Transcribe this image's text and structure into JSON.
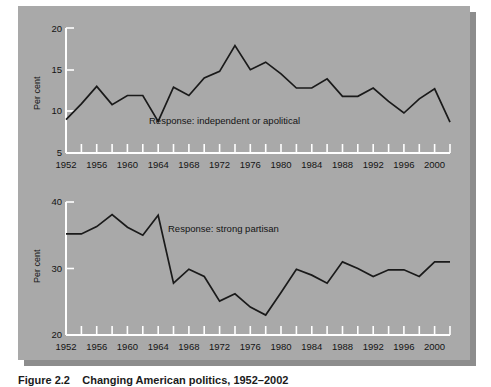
{
  "figure": {
    "caption_label": "Figure 2.2",
    "caption_text": "Changing American politics, 1952–2002",
    "background_color": "#a9a9a9",
    "shadow_color": "#8d8d8d",
    "line_color": "#1a1a1a",
    "axis_color": "#ffffff",
    "page_color": "#ffffff"
  },
  "chart_data": [
    {
      "id": "independent-apolitical",
      "type": "line",
      "title": "",
      "annotation": "Response: independent or apolitical",
      "xlabel": "",
      "ylabel": "Per cent",
      "ylim": [
        5,
        20
      ],
      "yticks": [
        5,
        10,
        15,
        20
      ],
      "ytick_labels": [
        "5",
        "10",
        "15",
        "20"
      ],
      "xlim": [
        1952,
        2002
      ],
      "xticks": [
        1952,
        1954,
        1956,
        1958,
        1960,
        1962,
        1964,
        1966,
        1968,
        1970,
        1972,
        1974,
        1976,
        1978,
        1980,
        1982,
        1984,
        1986,
        1988,
        1990,
        1992,
        1994,
        1996,
        1998,
        2000,
        2002
      ],
      "xtick_labels": [
        "1952",
        "",
        "1956",
        "",
        "1960",
        "",
        "1964",
        "",
        "1968",
        "",
        "1972",
        "",
        "1976",
        "",
        "1980",
        "",
        "1984",
        "",
        "1988",
        "",
        "1992",
        "",
        "1996",
        "",
        "2000",
        ""
      ],
      "grid": false,
      "legend": "none",
      "x": [
        1952,
        1954,
        1956,
        1958,
        1960,
        1962,
        1964,
        1966,
        1968,
        1970,
        1972,
        1974,
        1976,
        1978,
        1980,
        1982,
        1984,
        1986,
        1988,
        1990,
        1992,
        1994,
        1996,
        1998,
        2000,
        2002
      ],
      "values": [
        9.0,
        10.9,
        13.0,
        10.8,
        11.9,
        11.9,
        8.8,
        12.9,
        11.9,
        14.0,
        14.8,
        17.9,
        15.0,
        15.9,
        14.5,
        12.8,
        12.8,
        13.9,
        11.8,
        11.8,
        12.8,
        11.2,
        9.8,
        11.5,
        12.7,
        8.7
      ]
    },
    {
      "id": "strong-partisan",
      "type": "line",
      "title": "",
      "annotation": "Response: strong partisan",
      "xlabel": "",
      "ylabel": "Per cent",
      "ylim": [
        20,
        40
      ],
      "yticks": [
        20,
        30,
        40
      ],
      "ytick_labels": [
        "20",
        "30",
        "40"
      ],
      "xlim": [
        1952,
        2002
      ],
      "xticks": [
        1952,
        1954,
        1956,
        1958,
        1960,
        1962,
        1964,
        1966,
        1968,
        1970,
        1972,
        1974,
        1976,
        1978,
        1980,
        1982,
        1984,
        1986,
        1988,
        1990,
        1992,
        1994,
        1996,
        1998,
        2000,
        2002
      ],
      "xtick_labels": [
        "1952",
        "",
        "1956",
        "",
        "1960",
        "",
        "1964",
        "",
        "1968",
        "",
        "1972",
        "",
        "1976",
        "",
        "1980",
        "",
        "1984",
        "",
        "1988",
        "",
        "1992",
        "",
        "1996",
        "",
        "2000",
        ""
      ],
      "grid": false,
      "legend": "none",
      "x": [
        1952,
        1954,
        1956,
        1958,
        1960,
        1962,
        1964,
        1966,
        1968,
        1970,
        1972,
        1974,
        1976,
        1978,
        1980,
        1982,
        1984,
        1986,
        1988,
        1990,
        1992,
        1994,
        1996,
        1998,
        2000,
        2002
      ],
      "values": [
        35.2,
        35.2,
        36.3,
        38.1,
        36.2,
        35.0,
        38.0,
        27.8,
        29.9,
        28.8,
        25.1,
        26.2,
        24.2,
        23.0,
        26.4,
        29.9,
        29.0,
        27.8,
        31.0,
        30.0,
        28.8,
        29.8,
        29.8,
        28.8,
        31.0,
        31.0
      ]
    }
  ]
}
